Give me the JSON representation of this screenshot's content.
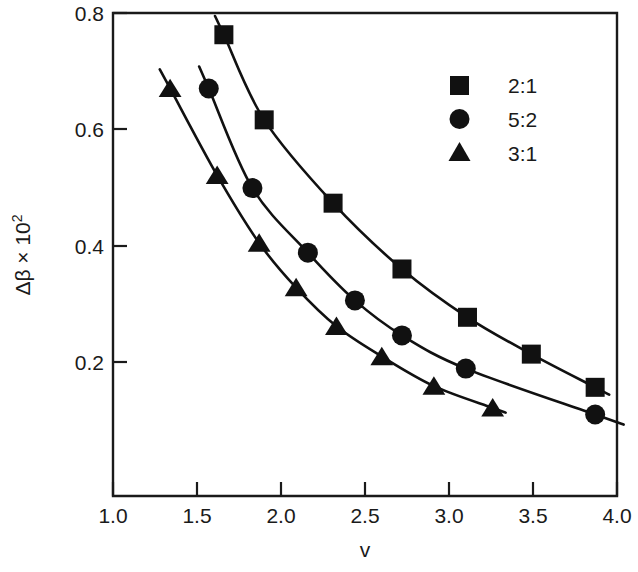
{
  "chart_data": {
    "type": "line",
    "title": "",
    "xlabel": "v",
    "ylabel": "Δβ × 10²",
    "ylabel_base": "Δβ × 10",
    "ylabel_exp": "2",
    "xlim": [
      1.0,
      4.0
    ],
    "ylim": [
      0.0,
      0.8
    ],
    "grid": false,
    "legend_position": "top-right",
    "xticks": [
      1.0,
      1.5,
      2.0,
      2.5,
      3.0,
      3.5,
      4.0
    ],
    "xtick_labels": [
      "1.0",
      "1.5",
      "2.0",
      "2.5",
      "3.0",
      "3.5",
      "4.0"
    ],
    "yticks": [
      0.2,
      0.4,
      0.6,
      0.8
    ],
    "ytick_labels": [
      "0.2",
      "0.4",
      "0.6",
      "0.8"
    ],
    "series": [
      {
        "name": "2:1",
        "marker": "square",
        "color": "#111111",
        "x": [
          1.66,
          1.9,
          2.31,
          2.72,
          3.11,
          3.49,
          3.87
        ],
        "y": [
          0.764,
          0.623,
          0.485,
          0.376,
          0.296,
          0.235,
          0.18
        ]
      },
      {
        "name": "5:2",
        "marker": "circle",
        "color": "#111111",
        "x": [
          1.57,
          1.83,
          2.16,
          2.44,
          2.72,
          3.1,
          3.87
        ],
        "y": [
          0.675,
          0.51,
          0.403,
          0.324,
          0.266,
          0.211,
          0.135
        ]
      },
      {
        "name": "3:1",
        "marker": "triangle",
        "color": "#111111",
        "x": [
          1.34,
          1.62,
          1.87,
          2.09,
          2.33,
          2.6,
          2.91,
          3.26
        ],
        "y": [
          0.675,
          0.531,
          0.419,
          0.345,
          0.281,
          0.231,
          0.182,
          0.146
        ]
      }
    ]
  },
  "legend": {
    "entries": [
      {
        "label": "2:1",
        "marker": "square"
      },
      {
        "label": "5:2",
        "marker": "circle"
      },
      {
        "label": "3:1",
        "marker": "triangle"
      }
    ]
  }
}
